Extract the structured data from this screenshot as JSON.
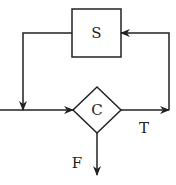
{
  "diagram": {
    "type": "flowchart-loop",
    "nodes": [
      {
        "id": "S",
        "shape": "rectangle",
        "label": "S"
      },
      {
        "id": "C",
        "shape": "diamond",
        "label": "C"
      }
    ],
    "edges": [
      {
        "from": "entry",
        "to": "C",
        "label": ""
      },
      {
        "from": "C",
        "to": "S",
        "label": "T"
      },
      {
        "from": "S",
        "to": "C",
        "label": ""
      },
      {
        "from": "C",
        "to": "exit",
        "label": "F"
      }
    ],
    "labels": {
      "statement": "S",
      "condition": "C",
      "true_branch": "T",
      "false_branch": "F"
    },
    "colors": {
      "stroke": "#222222",
      "background": "#ffffff"
    }
  }
}
